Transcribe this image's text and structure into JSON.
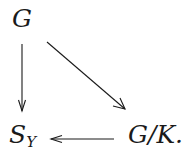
{
  "diagram": {
    "type": "commutative-diagram",
    "nodes": {
      "top_left": {
        "label": "G"
      },
      "bottom_left": {
        "label": "S",
        "subscript": "Y"
      },
      "bottom_right": {
        "label": "G/K."
      }
    },
    "arrows": [
      {
        "from": "top_left",
        "to": "bottom_left",
        "direction": "down"
      },
      {
        "from": "top_left",
        "to": "bottom_right",
        "direction": "diagonal"
      },
      {
        "from": "bottom_right",
        "to": "bottom_left",
        "direction": "left"
      }
    ],
    "colors": {
      "ink": "#1a1a1a",
      "background": "#ffffff"
    }
  }
}
